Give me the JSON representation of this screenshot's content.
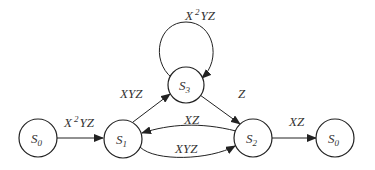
{
  "diagram": {
    "type": "state-transition",
    "nodes": [
      {
        "id": "s0_left",
        "base": "S",
        "sub": "0",
        "cx": 38,
        "cy": 138
      },
      {
        "id": "s1",
        "base": "S",
        "sub": "1",
        "cx": 123,
        "cy": 139
      },
      {
        "id": "s3",
        "base": "S",
        "sub": "3",
        "cx": 186,
        "cy": 85
      },
      {
        "id": "s2",
        "base": "S",
        "sub": "2",
        "cx": 253,
        "cy": 138
      },
      {
        "id": "s0_right",
        "base": "S",
        "sub": "0",
        "cx": 335,
        "cy": 138
      }
    ],
    "edges": [
      {
        "from": "s0_left",
        "to": "s1",
        "label_base": "X",
        "label_sup": "2",
        "label_rest": "YZ"
      },
      {
        "from": "s1",
        "to": "s3",
        "label": "XYZ"
      },
      {
        "from": "s3",
        "to": "s3",
        "label_base": "X",
        "label_sup": "2",
        "label_rest": "YZ"
      },
      {
        "from": "s3",
        "to": "s2",
        "label": "Z"
      },
      {
        "from": "s2",
        "to": "s1",
        "label": "XZ"
      },
      {
        "from": "s1",
        "to": "s2",
        "label": "XYZ"
      },
      {
        "from": "s2",
        "to": "s0_right",
        "label": "XZ"
      }
    ]
  }
}
